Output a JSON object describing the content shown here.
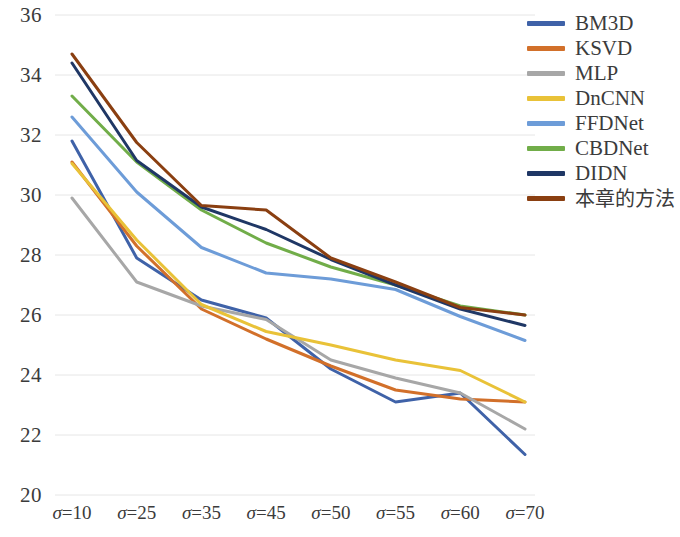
{
  "chart_data": {
    "type": "line",
    "title": "",
    "xlabel": "",
    "ylabel": "",
    "categories": [
      "σ=10",
      "σ=25",
      "σ=35",
      "σ=45",
      "σ=50",
      "σ=55",
      "σ=60",
      "σ=70"
    ],
    "ylim": [
      20,
      36
    ],
    "ytick_step": 2,
    "yticks": [
      36,
      34,
      32,
      30,
      28,
      26,
      24,
      22,
      20
    ],
    "grid": true,
    "legend_position": "right",
    "series": [
      {
        "name": "BM3D",
        "color": "#3f62a8",
        "values": [
          31.8,
          27.9,
          26.5,
          25.9,
          24.2,
          23.1,
          23.4,
          21.35
        ]
      },
      {
        "name": "KSVD",
        "color": "#d2702a",
        "values": [
          31.1,
          28.3,
          26.2,
          25.2,
          24.3,
          23.5,
          23.2,
          23.1
        ]
      },
      {
        "name": "MLP",
        "color": "#a7a7a7",
        "values": [
          29.9,
          27.1,
          26.3,
          25.85,
          24.5,
          23.9,
          23.4,
          22.2
        ]
      },
      {
        "name": "DnCNN",
        "color": "#e9c238",
        "values": [
          31.05,
          28.5,
          26.35,
          25.45,
          25.0,
          24.5,
          24.15,
          23.1
        ]
      },
      {
        "name": "FFDNet",
        "color": "#6d9cd8",
        "values": [
          32.6,
          30.1,
          28.25,
          27.4,
          27.2,
          26.85,
          25.95,
          25.15
        ]
      },
      {
        "name": "CBDNet",
        "color": "#71ad49",
        "values": [
          33.3,
          31.1,
          29.5,
          28.4,
          27.6,
          27.0,
          26.3,
          26.0
        ]
      },
      {
        "name": "DIDN",
        "color": "#1f3765",
        "values": [
          34.4,
          31.15,
          29.6,
          28.85,
          27.85,
          27.0,
          26.2,
          25.65
        ]
      },
      {
        "name": "本章的方法",
        "color": "#8a3f11",
        "values": [
          34.7,
          31.75,
          29.65,
          29.5,
          27.9,
          27.1,
          26.25,
          26.0
        ]
      }
    ]
  },
  "legend": {
    "items": [
      {
        "label": "BM3D",
        "color": "#3f62a8",
        "cjk": false
      },
      {
        "label": "KSVD",
        "color": "#d2702a",
        "cjk": false
      },
      {
        "label": "MLP",
        "color": "#a7a7a7",
        "cjk": false
      },
      {
        "label": "DnCNN",
        "color": "#e9c238",
        "cjk": false
      },
      {
        "label": "FFDNet",
        "color": "#6d9cd8",
        "cjk": false
      },
      {
        "label": "CBDNet",
        "color": "#71ad49",
        "cjk": false
      },
      {
        "label": "DIDN",
        "color": "#1f3765",
        "cjk": false
      },
      {
        "label": "本章的方法",
        "color": "#8a3f11",
        "cjk": true
      }
    ]
  },
  "style": {
    "gridline_color": "#e6e6e6",
    "text_color": "#3b3b3b",
    "background": "#ffffff",
    "line_width": 3
  }
}
